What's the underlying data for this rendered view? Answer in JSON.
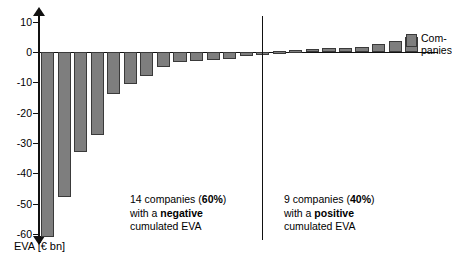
{
  "chart_data": {
    "type": "bar",
    "title": "",
    "subtitle": "",
    "xlabel": "Companies",
    "ylabel": "EVA [€ bn]",
    "ylim": [
      -65,
      10
    ],
    "yticks": [
      10,
      0,
      -10,
      -20,
      -30,
      -40,
      -50,
      -60
    ],
    "ytick_labels": [
      "10",
      "0",
      "-10",
      "-20",
      "-30",
      "-40",
      "-50",
      "-60"
    ],
    "grid": false,
    "legend_position": "right",
    "legend_entries": [
      "Com-\npanies"
    ],
    "categories": [
      "C1",
      "C2",
      "C3",
      "C4",
      "C5",
      "C6",
      "C7",
      "C8",
      "C9",
      "C10",
      "C11",
      "C12",
      "C13",
      "C14",
      "C15",
      "C16",
      "C17",
      "C18",
      "C19",
      "C20",
      "C21",
      "C22",
      "C23"
    ],
    "values": [
      -61.0,
      -48.0,
      -33.0,
      -27.5,
      -13.8,
      -10.5,
      -8.0,
      -5.0,
      -3.2,
      -3.0,
      -2.8,
      -2.2,
      -1.2,
      -0.8,
      0.3,
      0.5,
      0.9,
      1.2,
      1.4,
      1.6,
      2.6,
      3.6,
      5.0
    ],
    "series": [
      {
        "name": "Cumulated EVA per company",
        "values": [
          -61.0,
          -48.0,
          -33.0,
          -27.5,
          -13.8,
          -10.5,
          -8.0,
          -5.0,
          -3.2,
          -3.0,
          -2.8,
          -2.2,
          -1.2,
          -0.8,
          0.3,
          0.5,
          0.9,
          1.2,
          1.4,
          1.6,
          2.6,
          3.6,
          5.0
        ]
      }
    ],
    "annotations": [
      {
        "id": "negative-group",
        "lines": [
          [
            {
              "t": "14 companies (",
              "b": false
            },
            {
              "t": "60%",
              "b": true
            },
            {
              "t": ")",
              "b": false
            }
          ],
          [
            {
              "t": "with a ",
              "b": false
            },
            {
              "t": "negative",
              "b": true
            }
          ],
          [
            {
              "t": "cumulated EVA",
              "b": false
            }
          ]
        ]
      },
      {
        "id": "positive-group",
        "lines": [
          [
            {
              "t": "9 companies (",
              "b": false
            },
            {
              "t": "40%",
              "b": true
            },
            {
              "t": ")",
              "b": false
            }
          ],
          [
            {
              "t": "with a ",
              "b": false
            },
            {
              "t": "positive",
              "b": true
            }
          ],
          [
            {
              "t": "cumulated EVA",
              "b": false
            }
          ]
        ]
      }
    ],
    "divider": {
      "after_index": 13,
      "label": "separator between negative and positive groups"
    },
    "colors": {
      "bar_fill": "#7e7e7e",
      "bar_border": "#3a3a3a",
      "axis": "#111111",
      "text": "#000000",
      "background": "#ffffff"
    }
  },
  "axis": {
    "y_title": "EVA [€ bn]",
    "ticks": [
      "10",
      "0",
      "-10",
      "-20",
      "-30",
      "-40",
      "-50",
      "-60"
    ]
  },
  "legend": {
    "label": "Com-\npanies"
  }
}
